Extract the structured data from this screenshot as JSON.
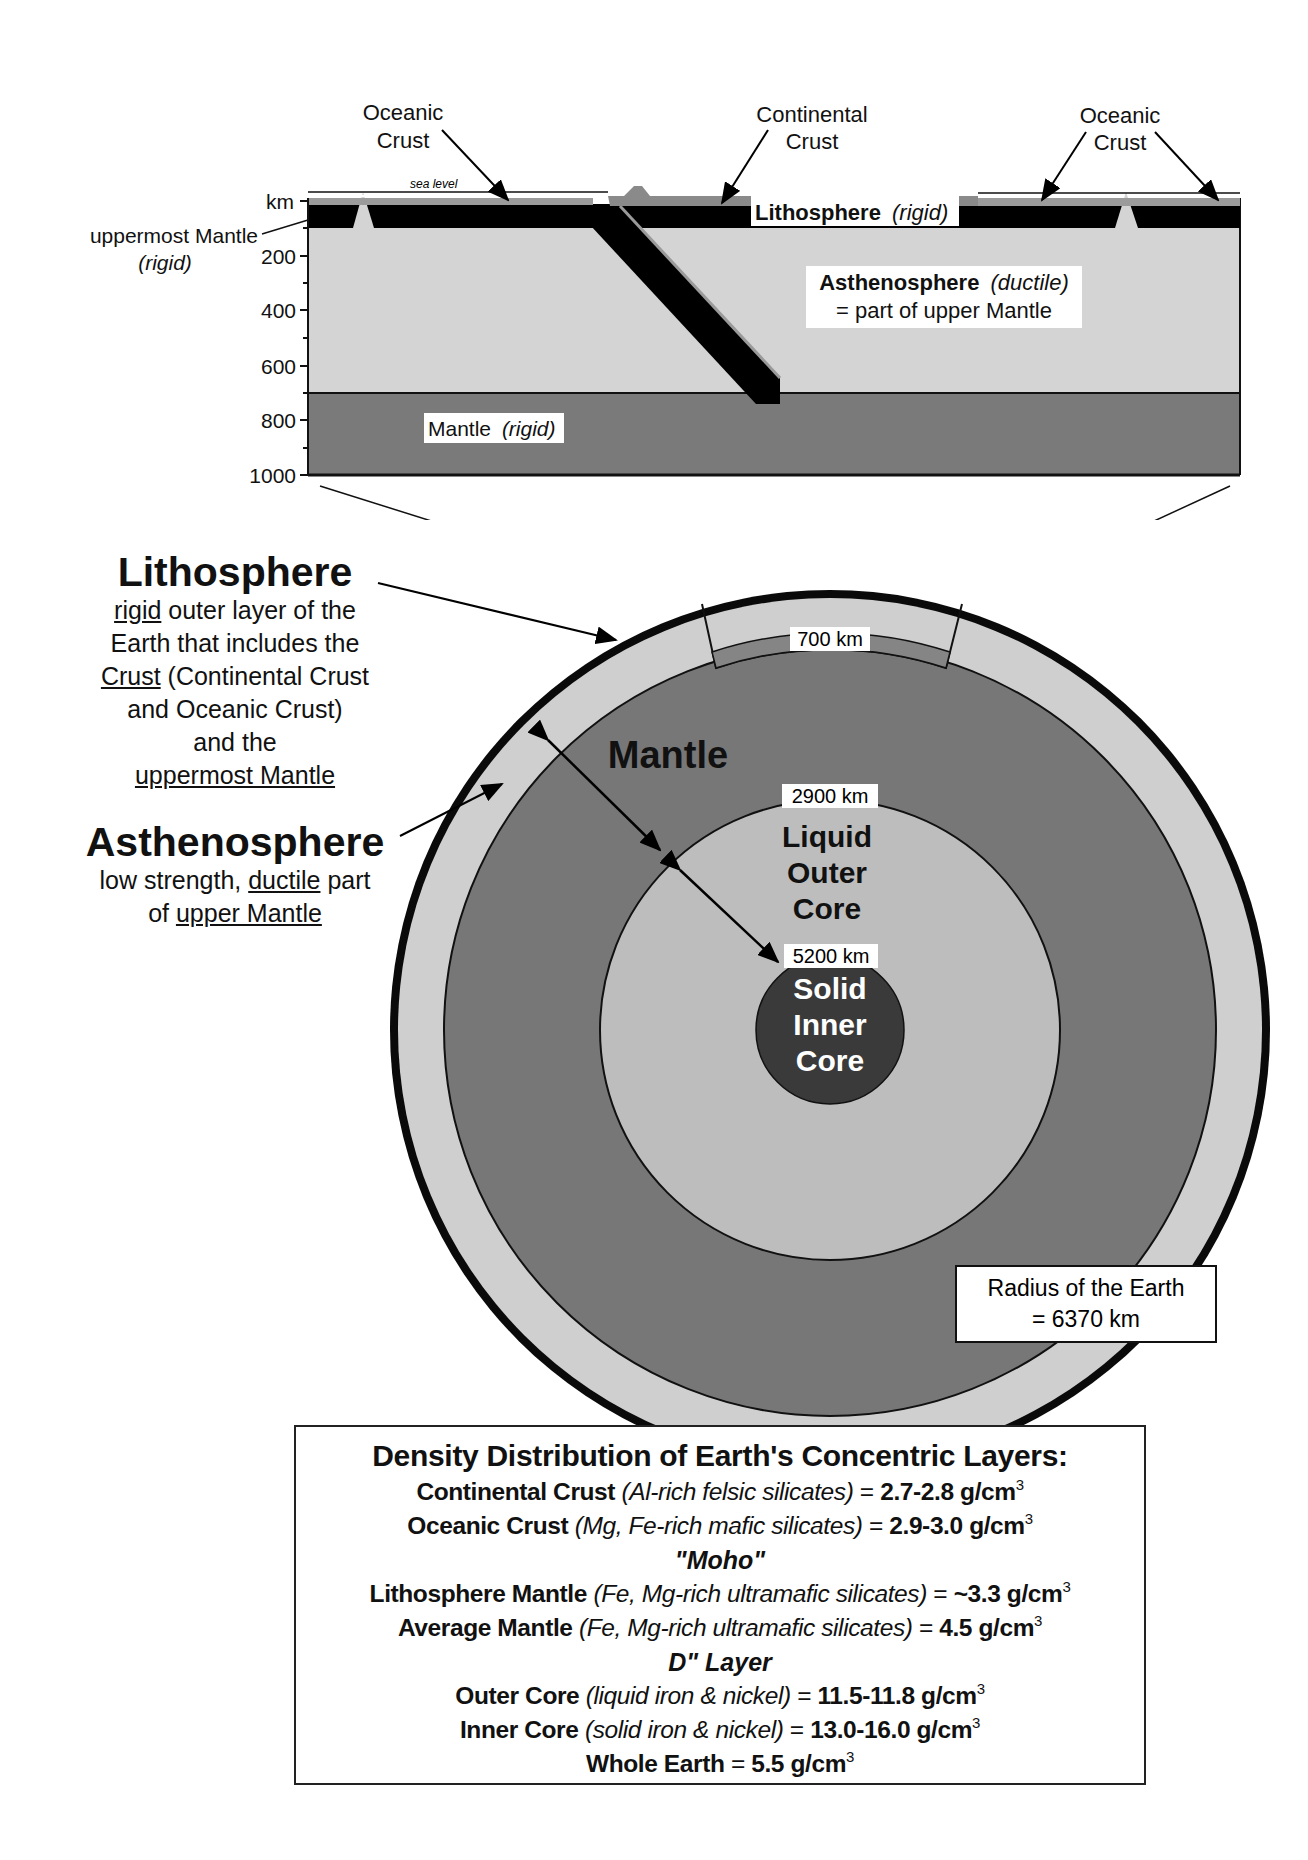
{
  "cross_section": {
    "axis_unit": "km",
    "depth_ticks": [
      "200",
      "400",
      "600",
      "800",
      "1000"
    ],
    "sea_level_label": "sea level",
    "callouts": {
      "oceanic_crust_left": [
        "Oceanic",
        "Crust"
      ],
      "continental_crust": [
        "Continental",
        "Crust"
      ],
      "oceanic_crust_right": [
        "Oceanic",
        "Crust"
      ],
      "uppermost_mantle": [
        "uppermost Mantle",
        "(rigid)"
      ]
    },
    "lithosphere_label": {
      "name": "Lithosphere",
      "qualifier": "(rigid)"
    },
    "asthenosphere_label": {
      "name": "Asthenosphere",
      "qualifier": "(ductile)",
      "note": "= part of upper Mantle"
    },
    "mantle_label": {
      "name": "Mantle",
      "qualifier": "(rigid)"
    }
  },
  "left_panel": {
    "lithosphere": {
      "heading": "Lithosphere",
      "lines": [
        {
          "u": "rigid",
          "rest": " outer layer of the"
        },
        {
          "text": "Earth that includes the"
        },
        {
          "u": "Crust",
          "rest": " (Continental Crust"
        },
        {
          "text": "and Oceanic Crust)"
        },
        {
          "text": "and the"
        },
        {
          "u": "uppermost Mantle",
          "rest": ""
        }
      ]
    },
    "asthenosphere": {
      "heading": "Asthenosphere",
      "line1_pre": "low strength, ",
      "line1_u": "ductile",
      "line1_post": " part",
      "line2_pre": "of ",
      "line2_u": "upper Mantle"
    }
  },
  "globe": {
    "depth_labels": {
      "d700": "700 km",
      "d2900": "2900 km",
      "d5200": "5200 km"
    },
    "mantle_label": "Mantle",
    "outer_core_label": [
      "Liquid",
      "Outer",
      "Core"
    ],
    "inner_core_label": [
      "Solid",
      "Inner",
      "Core"
    ],
    "radius_box": [
      "Radius of the Earth",
      "= 6370 km"
    ],
    "colors": {
      "lithosphere_ring": "#0a0a0a",
      "asthenosphere": "#cfcfcf",
      "mantle": "#777777",
      "outer_core": "#bdbdbd",
      "inner_core": "#3a3a3a"
    }
  },
  "density_table": {
    "title": "Density Distribution of Earth's Concentric Layers:",
    "rows": [
      {
        "layer": "Continental Crust",
        "composition": "(Al-rich felsic silicates)",
        "value": "2.7-2.8 g/cm",
        "exp": "3"
      },
      {
        "layer": "Oceanic Crust",
        "composition": "(Mg, Fe-rich mafic silicates)",
        "value": "2.9-3.0 g/cm",
        "exp": "3"
      },
      {
        "separator": "\"Moho\""
      },
      {
        "layer": "Lithosphere Mantle",
        "composition": "(Fe, Mg-rich ultramafic silicates)",
        "value": "~3.3 g/cm",
        "exp": "3"
      },
      {
        "layer": "Average Mantle",
        "composition": "(Fe, Mg-rich ultramafic silicates)",
        "value": "4.5 g/cm",
        "exp": "3"
      },
      {
        "separator": "D\" Layer"
      },
      {
        "layer": "Outer Core",
        "composition": "(liquid iron & nickel)",
        "value": "11.5-11.8 g/cm",
        "exp": "3"
      },
      {
        "layer": "Inner Core",
        "composition": "(solid iron & nickel)",
        "value": "13.0-16.0 g/cm",
        "exp": "3"
      },
      {
        "layer": "Whole Earth",
        "composition": "",
        "value": "5.5 g/cm",
        "exp": "3"
      }
    ]
  }
}
